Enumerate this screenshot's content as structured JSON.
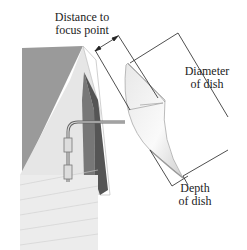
{
  "diagram": {
    "labels": {
      "focus": [
        "Distance to",
        "focus point"
      ],
      "diameter": [
        "Diameter",
        "of dish"
      ],
      "depth": [
        "Depth",
        "of dish"
      ]
    }
  }
}
